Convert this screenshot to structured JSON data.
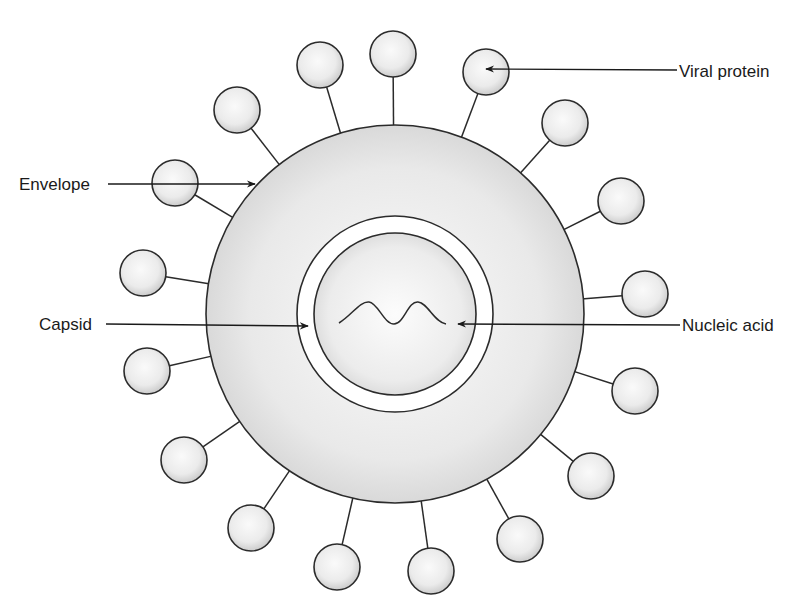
{
  "figure": {
    "type": "virus-structure-diagram",
    "colors": {
      "background": "#ffffff",
      "stroke": "#2b2b2b",
      "fill_light": "#f7f7f7",
      "fill_shade": "#d4d4d4",
      "ring_gap": "#ffffff"
    },
    "envelope": {
      "cx": 395,
      "cy": 314,
      "r": 189
    },
    "capsid": {
      "cx": 395,
      "cy": 314,
      "outer_r": 98,
      "inner_r": 81
    },
    "nucleic_acid": {
      "path": "M339,323 C352,315 360,301 369,302 C378,303 384,324 394,324 C404,324 408,301 418,302 C428,303 434,322 446,324"
    },
    "protein_radius": 23,
    "proteins": [
      {
        "cx": 237,
        "cy": 110
      },
      {
        "cx": 320,
        "cy": 65
      },
      {
        "cx": 393,
        "cy": 54
      },
      {
        "cx": 486,
        "cy": 72
      },
      {
        "cx": 565,
        "cy": 123
      },
      {
        "cx": 621,
        "cy": 201
      },
      {
        "cx": 645,
        "cy": 294
      },
      {
        "cx": 635,
        "cy": 391
      },
      {
        "cx": 591,
        "cy": 476
      },
      {
        "cx": 520,
        "cy": 539
      },
      {
        "cx": 431,
        "cy": 571
      },
      {
        "cx": 337,
        "cy": 567
      },
      {
        "cx": 251,
        "cy": 528
      },
      {
        "cx": 184,
        "cy": 460
      },
      {
        "cx": 147,
        "cy": 371
      },
      {
        "cx": 143,
        "cy": 273
      },
      {
        "cx": 175,
        "cy": 183
      }
    ]
  },
  "labels": [
    {
      "id": "envelope",
      "text": "Envelope",
      "x": 19,
      "y": 175,
      "arrow": {
        "x1": 108,
        "y1": 184,
        "x2": 255,
        "y2": 184
      }
    },
    {
      "id": "viral-protein",
      "text": "Viral protein",
      "x": 679,
      "y": 62,
      "arrow": {
        "x1": 677,
        "y1": 70,
        "x2": 486,
        "y2": 69
      }
    },
    {
      "id": "capsid",
      "text": "Capsid",
      "x": 39,
      "y": 315,
      "arrow": {
        "x1": 106,
        "y1": 324,
        "x2": 308,
        "y2": 326
      }
    },
    {
      "id": "nucleic-acid",
      "text": "Nucleic acid",
      "x": 682,
      "y": 316,
      "arrow": {
        "x1": 680,
        "y1": 325,
        "x2": 458,
        "y2": 324
      }
    }
  ]
}
